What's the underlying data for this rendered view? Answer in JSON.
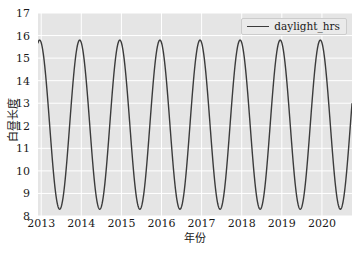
{
  "chart_data": {
    "type": "line",
    "title": "",
    "subtitle": "",
    "xlabel": "年份",
    "ylabel": "白昼长度",
    "xlim": [
      2012.92,
      2020.75
    ],
    "ylim": [
      8,
      17
    ],
    "xticks": [
      2013,
      2014,
      2015,
      2016,
      2017,
      2018,
      2019,
      2020
    ],
    "xtick_labels": [
      "2013",
      "2014",
      "2015",
      "2016",
      "2017",
      "2018",
      "2019",
      "2020"
    ],
    "yticks": [
      8,
      9,
      10,
      11,
      12,
      13,
      14,
      15,
      16,
      17
    ],
    "ytick_labels": [
      "8",
      "9",
      "10",
      "11",
      "12",
      "13",
      "14",
      "15",
      "16",
      "17"
    ],
    "grid": true,
    "grid_color": "#ffffff",
    "axes_facecolor": "#e5e5e5",
    "figure_facecolor": "#ffffff",
    "legend": {
      "position": "upper right",
      "entries": [
        {
          "name": "daylight_hrs",
          "color": "#3b3b3b",
          "style": "solid"
        }
      ]
    },
    "annotations": [],
    "series": [
      {
        "name": "daylight_hrs",
        "color": "#3b3b3b",
        "linewidth": 1.4,
        "units": "hours",
        "period_years": 1.0,
        "amplitude": 3.75,
        "mean": 12.05,
        "peak_value": 15.8,
        "trough_value": 8.3,
        "peak_month": "June",
        "trough_month": "December",
        "description": "Seasonal daylight hours oscillating sinusoidally between about 8.3 h at the winter solstice and 15.8 h at the summer solstice for each year from 2013 through mid 2020.",
        "x": [
          2012.92,
          2013.0,
          2013.08,
          2013.17,
          2013.25,
          2013.33,
          2013.42,
          2013.5,
          2013.58,
          2013.67,
          2013.75,
          2013.83,
          2013.92,
          2014.0,
          2014.08,
          2014.17,
          2014.25,
          2014.33,
          2014.42,
          2014.5,
          2014.58,
          2014.67,
          2014.75,
          2014.83,
          2014.92,
          2015.0,
          2015.08,
          2015.17,
          2015.25,
          2015.33,
          2015.42,
          2015.5,
          2015.58,
          2015.67,
          2015.75,
          2015.83,
          2015.92,
          2016.0,
          2016.08,
          2016.17,
          2016.25,
          2016.33,
          2016.42,
          2016.5,
          2016.58,
          2016.67,
          2016.75,
          2016.83,
          2016.92,
          2017.0,
          2017.08,
          2017.17,
          2017.25,
          2017.33,
          2017.42,
          2017.5,
          2017.58,
          2017.67,
          2017.75,
          2017.83,
          2017.92,
          2018.0,
          2018.08,
          2018.17,
          2018.25,
          2018.33,
          2018.42,
          2018.5,
          2018.58,
          2018.67,
          2018.75,
          2018.83,
          2018.92,
          2019.0,
          2019.08,
          2019.17,
          2019.25,
          2019.33,
          2019.42,
          2019.5,
          2019.58,
          2019.67,
          2019.75,
          2019.83,
          2019.92,
          2020.0,
          2020.08,
          2020.17,
          2020.25,
          2020.33,
          2020.42,
          2020.5,
          2020.58,
          2020.67,
          2020.75
        ],
        "y": [
          11.05,
          9.55,
          8.55,
          8.32,
          9.05,
          10.55,
          12.3,
          13.95,
          15.2,
          15.78,
          15.55,
          14.5,
          13.0,
          11.3,
          9.7,
          8.62,
          8.3,
          8.95,
          10.4,
          12.15,
          13.85,
          15.12,
          15.78,
          15.6,
          14.6,
          13.1,
          11.45,
          9.82,
          8.68,
          8.3,
          8.88,
          10.28,
          12.0,
          13.72,
          15.05,
          15.76,
          15.64,
          14.7,
          13.22,
          11.58,
          9.95,
          8.75,
          8.3,
          8.82,
          10.15,
          11.85,
          13.6,
          14.98,
          15.74,
          15.68,
          14.8,
          13.35,
          11.7,
          10.08,
          8.85,
          8.31,
          8.76,
          10.02,
          11.7,
          13.48,
          14.9,
          15.72,
          15.72,
          14.88,
          13.48,
          11.85,
          10.2,
          8.95,
          8.32,
          8.7,
          9.9,
          11.55,
          13.35,
          14.82,
          15.7,
          15.76,
          14.96,
          13.6,
          12.0,
          10.32,
          9.05,
          8.34,
          8.65,
          9.78,
          11.4,
          13.22,
          14.72,
          15.66,
          15.78,
          15.04,
          13.72,
          12.15,
          10.45,
          9.15,
          15.7
        ]
      }
    ]
  }
}
